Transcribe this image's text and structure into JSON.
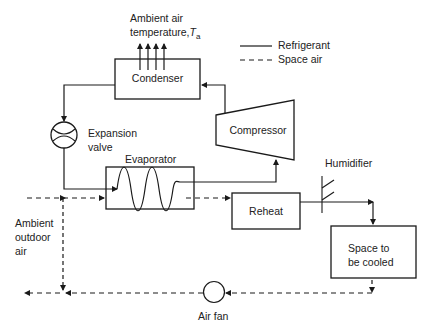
{
  "diagram": {
    "type": "air-conditioning refrigeration cycle schematic",
    "legend": {
      "refrigerant": "Refrigerant",
      "space_air": "Space air"
    },
    "labels": {
      "ambient_air_line1": "Ambient air",
      "ambient_air_line2": "temperature,",
      "ambient_air_symbol": "T",
      "ambient_air_subscript": "a",
      "expansion_valve_line1": "Expansion",
      "expansion_valve_line2": "valve",
      "evaporator": "Evaporator",
      "humidifier": "Humidifier",
      "ambient_outdoor_line1": "Ambient",
      "ambient_outdoor_line2": "outdoor",
      "ambient_outdoor_line3": "air",
      "air_fan": "Air fan"
    },
    "components": {
      "condenser": "Condenser",
      "compressor": "Compressor",
      "reheat": "Reheat",
      "space_line1": "Space to",
      "space_line2": "be cooled"
    },
    "colors": {
      "line": "#1a1a1a",
      "background": "#ffffff"
    }
  }
}
